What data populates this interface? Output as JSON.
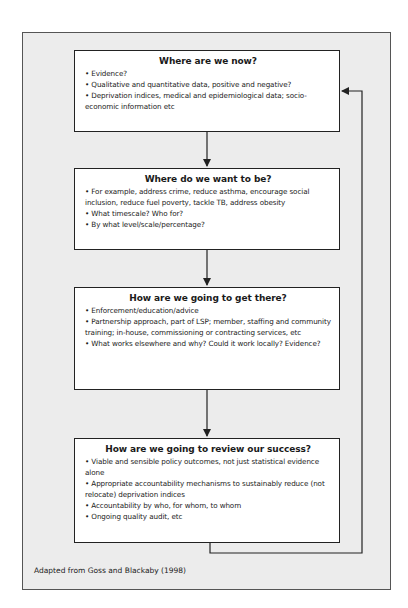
{
  "diagram": {
    "type": "flowchart-cycle",
    "caption": "Adapted from Goss and Blackaby (1998)",
    "boxes": [
      {
        "title": "Where are we now?",
        "items": [
          "Evidence?",
          "Qualitative and quantitative data, positive and negative?",
          "Deprivation indices, medical and epidemiological data; socio-economic information etc"
        ]
      },
      {
        "title": "Where do we want to be?",
        "items": [
          "For example, address crime, reduce asthma, encourage social inclusion, reduce fuel poverty, tackle TB, address obesity",
          "What timescale? Who for?",
          "By what level/scale/percentage?"
        ]
      },
      {
        "title": "How are we going to get there?",
        "items": [
          "Enforcement/education/advice",
          "Partnership approach, part of LSP; member, staffing and community training; in-house, commissioning or contracting services, etc",
          "What works elsewhere and why? Could it work locally? Evidence?"
        ]
      },
      {
        "title": "How are we going to review our success?",
        "items": [
          "Viable and sensible policy outcomes, not just statistical evidence alone",
          "Appropriate accountability mechanisms to sustainably reduce (not relocate) deprivation indices",
          "Accountability by who, for whom, to whom",
          "Ongoing quality audit, etc"
        ]
      }
    ],
    "edges": [
      {
        "from": 0,
        "to": 1,
        "style": "arrow-down"
      },
      {
        "from": 1,
        "to": 2,
        "style": "arrow-down"
      },
      {
        "from": 2,
        "to": 3,
        "style": "arrow-down"
      },
      {
        "from": 3,
        "to": 0,
        "style": "feedback-loop-right"
      }
    ],
    "colors": {
      "frame_bg": "#ececec",
      "box_bg": "#ffffff",
      "stroke": "#222222"
    }
  }
}
